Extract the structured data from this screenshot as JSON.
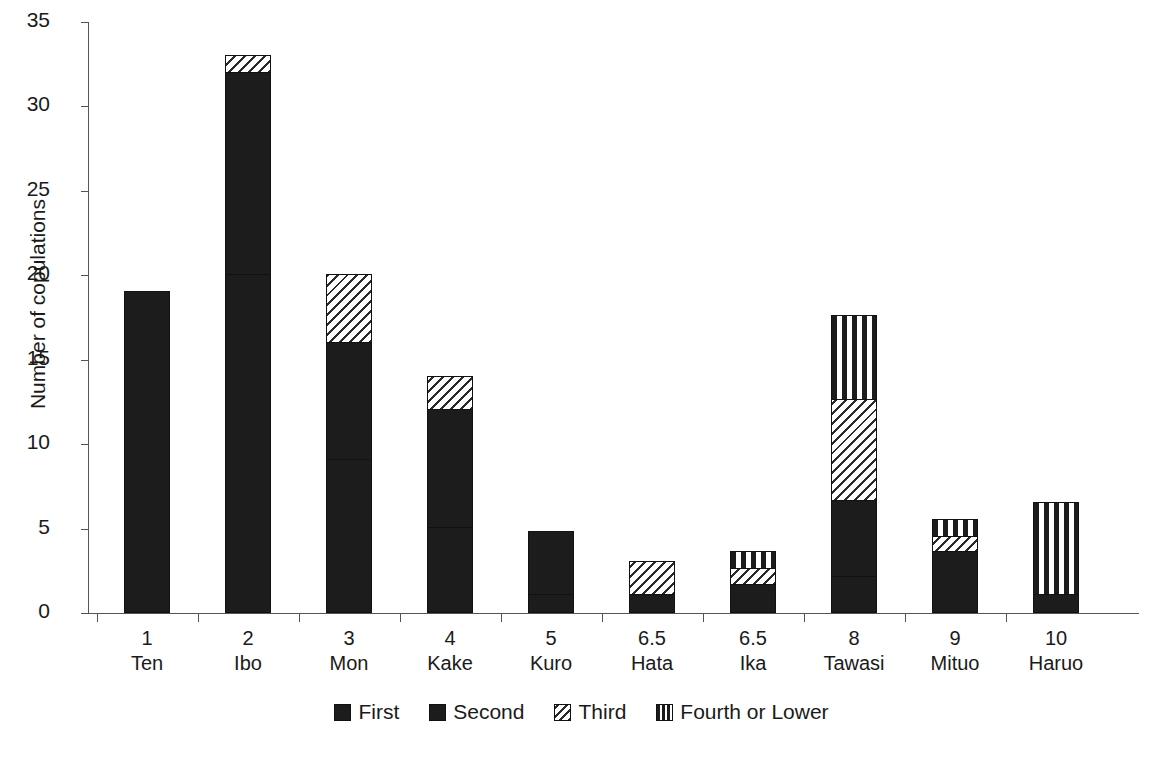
{
  "chart_data": {
    "type": "bar",
    "stacked": true,
    "title": "",
    "xlabel": "",
    "ylabel": "Number of copulations",
    "ylim": [
      0,
      35
    ],
    "ytick_step": 5,
    "yticks": [
      0,
      5,
      10,
      15,
      20,
      25,
      30,
      35
    ],
    "grid": false,
    "legend_position": "bottom-center",
    "categories": [
      "Ten",
      "Ibo",
      "Mon",
      "Kake",
      "Kuro",
      "Hata",
      "Ika",
      "Tawasi",
      "Mituo",
      "Haruo"
    ],
    "ranks": [
      "1",
      "2",
      "3",
      "4",
      "5",
      "6.5",
      "6.5",
      "8",
      "9",
      "10"
    ],
    "series": [
      {
        "name": "First",
        "values": [
          19,
          20,
          9,
          5,
          1,
          1,
          1.6,
          2.1,
          3.6,
          1
        ]
      },
      {
        "name": "Second",
        "values": [
          0,
          12,
          7,
          7,
          3.8,
          0,
          0,
          4.5,
          0,
          0
        ]
      },
      {
        "name": "Third",
        "values": [
          0,
          1,
          4,
          2,
          0,
          2,
          1,
          6,
          0.9,
          0
        ]
      },
      {
        "name": "Fourth or Lower",
        "values": [
          0,
          0,
          0,
          0,
          0,
          0,
          1,
          5,
          1,
          5.5
        ]
      }
    ],
    "totals": [
      19,
      33,
      20,
      14,
      4.8,
      3,
      3.6,
      17.6,
      5.5,
      6.5
    ],
    "legend": [
      "First",
      "Second",
      "Third",
      "Fourth or Lower"
    ],
    "colors": {
      "first": "#1c1c1c",
      "second": "#1c1c1c",
      "third": "#2a2a2a",
      "fourth": "#1c1c1c",
      "background": "#ffffff",
      "axis": "#555555",
      "text": "#1a1a1a"
    },
    "patterns": {
      "first": "solid-black",
      "second": "checkered",
      "third": "diagonal-hatch",
      "fourth": "vertical-stripes"
    }
  }
}
